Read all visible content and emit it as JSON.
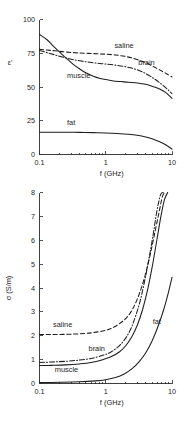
{
  "figure": {
    "background": "#ffffff",
    "ink": "#1d1d1d"
  },
  "chart_data": [
    {
      "id": "permittivity",
      "type": "line",
      "title": "",
      "xlabel": "f (GHz)",
      "ylabel": "ε'",
      "xscale": "log",
      "xlim": [
        0.1,
        10
      ],
      "ylim": [
        0,
        100
      ],
      "xticks": [
        0.1,
        1,
        10
      ],
      "xticklabels": [
        "0.1",
        "1",
        "10"
      ],
      "yticks": [
        0,
        25,
        50,
        75,
        100
      ],
      "yticklabels": [
        "0",
        "25",
        "50",
        "75",
        "100"
      ],
      "grid": false,
      "legend": "inline-annotations",
      "series": [
        {
          "name": "muscle",
          "style": "solid",
          "label": "muscle",
          "label_x": 0.26,
          "label_y": 57,
          "x": [
            0.1,
            0.13,
            0.16,
            0.2,
            0.25,
            0.32,
            0.4,
            0.5,
            0.65,
            0.8,
            1.0,
            1.3,
            1.7,
            2.2,
            3.0,
            4.0,
            5.0,
            6.5,
            8.0,
            10.0
          ],
          "y": [
            89,
            85,
            80.5,
            76,
            71.5,
            67,
            63.5,
            60.5,
            58,
            56.5,
            55.5,
            54.5,
            54,
            53.5,
            53,
            52,
            50.5,
            48.5,
            46,
            41.5
          ]
        },
        {
          "name": "saline",
          "style": "dashed",
          "label": "saline",
          "label_x": 1.35,
          "label_y": 79,
          "x": [
            0.1,
            0.13,
            0.17,
            0.22,
            0.3,
            0.4,
            0.55,
            0.75,
            1.0,
            1.4,
            2.0,
            2.8,
            4.0,
            5.5,
            7.0,
            8.5,
            10.0
          ],
          "y": [
            78,
            77.4,
            76.8,
            76.2,
            75.6,
            75.2,
            74.9,
            74.6,
            74.3,
            73.7,
            72.6,
            70.8,
            68.0,
            64.6,
            61.8,
            59.5,
            57.5
          ]
        },
        {
          "name": "brain",
          "style": "dashdot",
          "label": "brain",
          "label_x": 3.1,
          "label_y": 66,
          "x": [
            0.1,
            0.13,
            0.17,
            0.22,
            0.3,
            0.4,
            0.55,
            0.75,
            1.0,
            1.4,
            2.0,
            2.8,
            4.0,
            5.5,
            7.0,
            8.5,
            10.0
          ],
          "y": [
            77,
            75.5,
            73.8,
            72.2,
            70.6,
            69.4,
            68.4,
            67.6,
            67.0,
            66.2,
            65.0,
            63.2,
            60.0,
            55.8,
            52.0,
            48.4,
            45.0
          ]
        },
        {
          "name": "fat",
          "style": "solid",
          "label": "fat",
          "label_x": 0.26,
          "label_y": 22,
          "x": [
            0.1,
            0.15,
            0.25,
            0.4,
            0.65,
            1.0,
            1.5,
            2.2,
            3.0,
            4.0,
            5.0,
            6.5,
            8.0,
            10.0
          ],
          "y": [
            16.5,
            16.5,
            16.5,
            16.4,
            16.2,
            16.0,
            15.6,
            15.0,
            14.2,
            13.0,
            11.6,
            9.4,
            7.2,
            4.0
          ]
        }
      ]
    },
    {
      "id": "conductivity",
      "type": "line",
      "title": "",
      "xlabel": "f (GHz)",
      "ylabel": "σ (S/m)",
      "xscale": "log",
      "xlim": [
        0.1,
        10
      ],
      "ylim": [
        0,
        8
      ],
      "xticks": [
        0.1,
        1,
        10
      ],
      "xticklabels": [
        "0.1",
        "1",
        "10"
      ],
      "yticks": [
        0,
        1,
        2,
        3,
        4,
        5,
        6,
        7,
        8
      ],
      "yticklabels": [
        "0",
        "1",
        "2",
        "3",
        "4",
        "5",
        "6",
        "7",
        "8"
      ],
      "grid": false,
      "legend": "inline-annotations",
      "series": [
        {
          "name": "saline",
          "style": "dashed",
          "label": "saline",
          "label_x": 0.16,
          "label_y": 2.35,
          "x": [
            0.1,
            0.15,
            0.25,
            0.4,
            0.6,
            0.9,
            1.2,
            1.6,
            2.0,
            2.4,
            2.8,
            3.3,
            3.9,
            4.6,
            5.4,
            6.3,
            7.2,
            8.0
          ],
          "y": [
            2.05,
            2.05,
            2.06,
            2.08,
            2.12,
            2.2,
            2.3,
            2.5,
            2.72,
            3.0,
            3.35,
            3.85,
            4.5,
            5.3,
            6.2,
            7.1,
            7.85,
            8.0
          ]
        },
        {
          "name": "brain",
          "style": "dashdot",
          "label": "brain",
          "label_x": 0.55,
          "label_y": 1.35,
          "x": [
            0.1,
            0.15,
            0.25,
            0.4,
            0.6,
            0.9,
            1.2,
            1.6,
            2.0,
            2.4,
            2.8,
            3.3,
            3.8,
            4.4,
            5.1,
            5.9,
            6.7,
            7.4
          ],
          "y": [
            0.88,
            0.9,
            0.93,
            0.98,
            1.05,
            1.18,
            1.32,
            1.58,
            1.9,
            2.3,
            2.8,
            3.45,
            4.2,
            5.1,
            6.1,
            7.2,
            7.9,
            8.0
          ]
        },
        {
          "name": "muscle",
          "style": "solid",
          "label": "muscle",
          "label_x": 0.17,
          "label_y": 0.48,
          "x": [
            0.1,
            0.15,
            0.25,
            0.4,
            0.6,
            0.9,
            1.2,
            1.6,
            2.0,
            2.5,
            3.0,
            3.6,
            4.3,
            5.0,
            5.9,
            6.8,
            7.7,
            8.6
          ],
          "y": [
            0.75,
            0.76,
            0.78,
            0.82,
            0.88,
            1.0,
            1.12,
            1.32,
            1.58,
            1.98,
            2.45,
            3.1,
            3.95,
            4.85,
            6.0,
            7.0,
            7.7,
            8.0
          ]
        },
        {
          "name": "fat",
          "style": "solid",
          "label": "fat",
          "label_x": 5.1,
          "label_y": 2.5,
          "x": [
            0.1,
            0.2,
            0.4,
            0.7,
            1.0,
            1.4,
            1.9,
            2.5,
            3.2,
            4.0,
            5.0,
            6.2,
            7.5,
            8.8,
            10.0
          ],
          "y": [
            0.04,
            0.05,
            0.07,
            0.11,
            0.16,
            0.25,
            0.4,
            0.62,
            0.92,
            1.28,
            1.78,
            2.42,
            3.1,
            3.8,
            4.45
          ]
        }
      ]
    }
  ]
}
